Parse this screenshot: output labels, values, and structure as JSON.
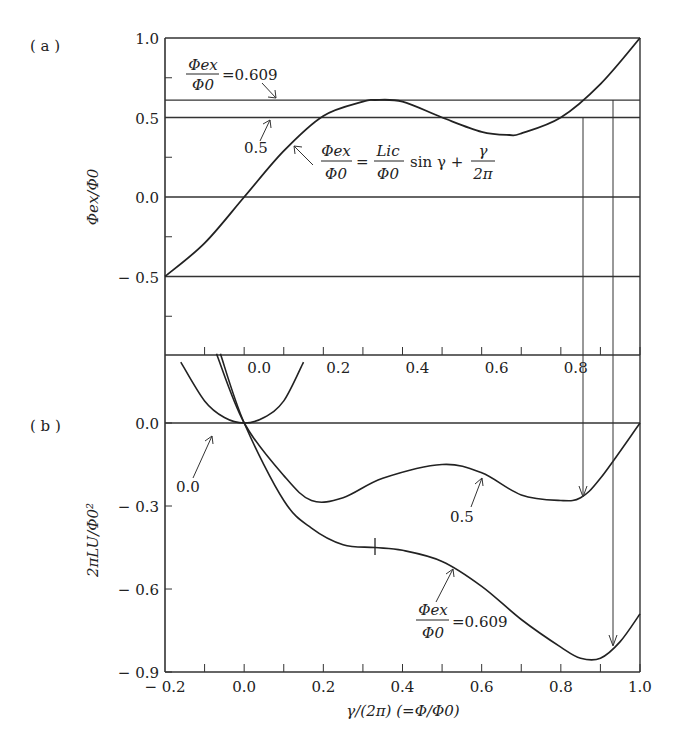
{
  "chart_data": [
    {
      "panel": "(a)",
      "type": "line",
      "title": "",
      "xlabel": "",
      "ylabel": "Φex/Φ0",
      "ylim": [
        -1.0,
        1.0
      ],
      "xlim": [
        -0.2,
        1.0
      ],
      "yticks": [
        "1.0",
        "0.5",
        "0.0",
        "− 0.5"
      ],
      "ytick_values": [
        1.0,
        0.5,
        0.0,
        -0.5
      ],
      "grid": false,
      "horizontal_lines": [
        0.609,
        0.5,
        0.0,
        -0.5
      ],
      "series": [
        {
          "name": "Φex/Φ0 = (Li_c/Φ0) sin γ + γ/(2π)",
          "x": [
            -0.2,
            -0.1,
            0.0,
            0.1,
            0.2,
            0.3,
            0.33,
            0.4,
            0.5,
            0.6,
            0.67,
            0.7,
            0.8,
            0.9,
            1.0
          ],
          "values": [
            -0.5,
            -0.29,
            0.0,
            0.29,
            0.51,
            0.6,
            0.61,
            0.6,
            0.5,
            0.41,
            0.39,
            0.4,
            0.5,
            0.71,
            1.0
          ]
        }
      ],
      "annotations": [
        {
          "text": "Φex/Φ0 = 0.609",
          "target": "line 0.609"
        },
        {
          "text": "0.5",
          "target": "line 0.5"
        },
        {
          "text": "Φex/Φ0 = (Li_c/Φ0) sin γ + γ/(2π)",
          "target": "curve"
        }
      ]
    },
    {
      "panel": "(b)",
      "type": "line",
      "title": "",
      "xlabel": "γ/(2π)  (=Φ/Φ0)",
      "ylabel": "2πLU/Φ0²",
      "xlim": [
        -0.2,
        1.0
      ],
      "ylim": [
        -0.9,
        0.25
      ],
      "xticks": [
        "− 0.2",
        "0.0",
        "0.2",
        "0.4",
        "0.6",
        "0.8",
        "1.0"
      ],
      "xtick_values": [
        -0.2,
        0.0,
        0.2,
        0.4,
        0.6,
        0.8,
        1.0
      ],
      "yticks": [
        "0.0",
        "− 0.3",
        "− 0.6",
        "− 0.9"
      ],
      "ytick_values": [
        0.0,
        -0.3,
        -0.6,
        -0.9
      ],
      "grid": false,
      "series": [
        {
          "name": "Φex/Φ0 = 0.0",
          "x": [
            -0.16,
            -0.1,
            -0.05,
            0.0,
            0.05,
            0.1,
            0.15
          ],
          "values": [
            0.22,
            0.08,
            0.02,
            0.0,
            0.02,
            0.08,
            0.22
          ]
        },
        {
          "name": "Φex/Φ0 = 0.5",
          "x": [
            -0.07,
            0.0,
            0.1,
            0.17,
            0.25,
            0.35,
            0.5,
            0.6,
            0.7,
            0.8,
            0.85,
            0.9,
            1.0
          ],
          "values": [
            0.25,
            0.0,
            -0.19,
            -0.28,
            -0.27,
            -0.2,
            -0.15,
            -0.18,
            -0.26,
            -0.28,
            -0.27,
            -0.2,
            0.0
          ]
        },
        {
          "name": "Φex/Φ0 = 0.609",
          "x": [
            -0.06,
            0.0,
            0.1,
            0.17,
            0.25,
            0.33,
            0.4,
            0.5,
            0.6,
            0.7,
            0.8,
            0.85,
            0.9,
            0.95,
            1.0
          ],
          "values": [
            0.25,
            0.0,
            -0.28,
            -0.38,
            -0.44,
            -0.45,
            -0.46,
            -0.5,
            -0.59,
            -0.71,
            -0.81,
            -0.85,
            -0.85,
            -0.79,
            -0.69
          ]
        }
      ],
      "annotations": [
        {
          "text": "0.0",
          "target": "curve Φex/Φ0 = 0.0"
        },
        {
          "text": "0.5",
          "target": "curve Φex/Φ0 = 0.5"
        },
        {
          "text": "Φex/Φ0 = 0.609",
          "target": "curve Φex/Φ0 = 0.609"
        }
      ],
      "projection_arrows": [
        {
          "x": 0.855,
          "from": "(a) Φex/Φ0 = 0.5",
          "to": "(b) 0.5 curve minimum"
        },
        {
          "x": 0.93,
          "from": "(a) Φex/Φ0 = 0.609",
          "to": "(b) 0.609 curve"
        }
      ]
    }
  ],
  "labels": {
    "panel_a": "( a )",
    "panel_b": "( b )",
    "ylabel_a": "Φex/Φ0",
    "ylabel_b": "2πLU/Φ0²",
    "xlabel": "γ/(2π)  (=Φ/Φ0)",
    "ann_a_0609_num": "Φex",
    "ann_a_0609_den": "Φ0",
    "ann_a_0609_val": "=0.609",
    "ann_a_05": "0.5",
    "eq_lhs_num": "Φex",
    "eq_lhs_den": "Φ0",
    "eq_mid_num": "Lic",
    "eq_mid_den": "Φ0",
    "eq_sin": "sin γ +",
    "eq_r_num": "γ",
    "eq_r_den": "2π",
    "eq_equals": "=",
    "ann_b_00": "0.0",
    "ann_b_05": "0.5",
    "ann_b_0609_num": "Φex",
    "ann_b_0609_den": "Φ0",
    "ann_b_0609_val": "=0.609"
  }
}
